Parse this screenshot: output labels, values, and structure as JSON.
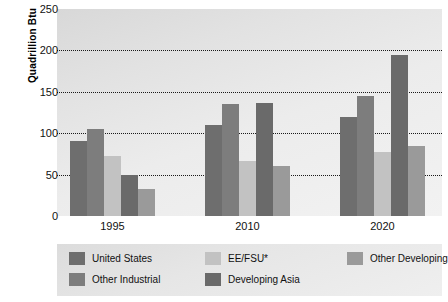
{
  "chart_data": {
    "type": "bar",
    "title": "",
    "xlabel": "",
    "ylabel": "Quadrillion Btu",
    "ylim": [
      0,
      250
    ],
    "yticks": [
      0,
      50,
      100,
      150,
      200,
      250
    ],
    "grid": "horizontal-dotted",
    "legend_position": "bottom",
    "categories": [
      "1995",
      "2010",
      "2020"
    ],
    "series": [
      {
        "name": "United States",
        "color": "#6e6e6e",
        "values": [
          91,
          110,
          120
        ]
      },
      {
        "name": "Other Industrial",
        "color": "#7d7d7d",
        "values": [
          105,
          135,
          145
        ]
      },
      {
        "name": "EE/FSU*",
        "color": "#c2c2c2",
        "values": [
          72,
          67,
          77
        ]
      },
      {
        "name": "Developing Asia",
        "color": "#6a6a6a",
        "values": [
          50,
          137,
          194
        ]
      },
      {
        "name": "Other Developing",
        "color": "#9a9a9a",
        "values": [
          33,
          61,
          84
        ]
      }
    ]
  },
  "axis": {
    "y_title": "Quadrillion Btu",
    "y_tick_labels": [
      "250",
      "200",
      "150",
      "100",
      "50",
      "0"
    ],
    "x_tick_labels": [
      "1995",
      "2010",
      "2020"
    ]
  },
  "legend": {
    "items": [
      {
        "label": "United States",
        "color": "#6e6e6e"
      },
      {
        "label": "Other Industrial",
        "color": "#7d7d7d"
      },
      {
        "label": "EE/FSU*",
        "color": "#c2c2c2"
      },
      {
        "label": "Developing Asia",
        "color": "#6a6a6a"
      },
      {
        "label": "Other Developing",
        "color": "#9a9a9a"
      }
    ]
  }
}
